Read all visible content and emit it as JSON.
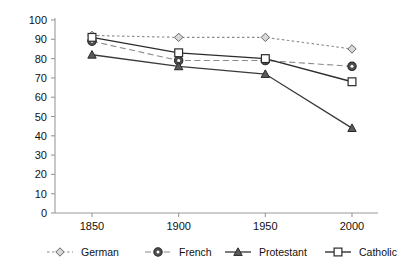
{
  "chart_data": {
    "type": "line",
    "title": "",
    "subtitle": "",
    "xlabel": "",
    "ylabel": "",
    "categories": [
      "1850",
      "1900",
      "1950",
      "2000"
    ],
    "x": [
      1850,
      1900,
      1950,
      2000
    ],
    "ylim": [
      0,
      100
    ],
    "yticks": [
      0,
      10,
      20,
      30,
      40,
      50,
      60,
      70,
      80,
      90,
      100
    ],
    "ytick_labels": [
      "0",
      "10",
      "20",
      "30",
      "40",
      "50",
      "60",
      "70",
      "80",
      "90",
      "100"
    ],
    "xtick_labels": [
      "1850",
      "1900",
      "1950",
      "2000"
    ],
    "grid": false,
    "legend_position": "bottom",
    "series": [
      {
        "name": "German",
        "values": [
          92,
          91,
          91,
          85
        ],
        "marker": "open-diamond",
        "linestyle": "dotted",
        "color": "#8a8a8a",
        "marker_fill": "#d8d8d8",
        "marker_edge": "#666666"
      },
      {
        "name": "French",
        "values": [
          89,
          79,
          79,
          76
        ],
        "marker": "filled-circle",
        "linestyle": "dashed",
        "color": "#8a8a8a",
        "marker_fill": "#4d4d4d",
        "marker_edge": "#2b2b2b"
      },
      {
        "name": "Protestant",
        "values": [
          82,
          76,
          72,
          44
        ],
        "marker": "filled-triangle",
        "linestyle": "solid",
        "color": "#3a3a3a",
        "marker_fill": "#5a5a5a",
        "marker_edge": "#2b2b2b"
      },
      {
        "name": "Catholic",
        "values": [
          91,
          83,
          80,
          68
        ],
        "marker": "open-square",
        "linestyle": "solid",
        "color": "#2b2b2b",
        "marker_fill": "#ffffff",
        "marker_edge": "#2b2b2b"
      }
    ]
  },
  "legend": {
    "entries": [
      {
        "label": "German"
      },
      {
        "label": "French"
      },
      {
        "label": "Protestant"
      },
      {
        "label": "Catholic"
      }
    ]
  },
  "axes": {
    "axis_color": "#9a9a9a",
    "tick_color": "#9a9a9a"
  }
}
